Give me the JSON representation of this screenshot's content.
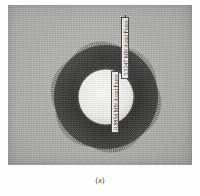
{
  "figure": {
    "caption": "(a)",
    "panel": {
      "background_color": "#b2b2b0",
      "description": "Radial axial-force vector plot around an annular cross-section"
    },
    "annotations": [
      {
        "name": "inner-axial-force-label",
        "text": "0.8854 MN Axial Force",
        "value": 0.8854,
        "unit": "MN",
        "quantity": "Axial Force",
        "orientation": "vertical"
      },
      {
        "name": "outer-axial-force-label",
        "text": "3.5247 MN Axial Force",
        "value": 3.5247,
        "unit": "MN",
        "quantity": "Axial Force",
        "orientation": "vertical"
      }
    ]
  },
  "chart_data": {
    "type": "scatter",
    "title": "",
    "subtitle": "",
    "xlabel": "",
    "ylabel": "",
    "legend_position": "none",
    "grid": false,
    "plot_style": "radial vector rosette (spoke plot) on annular section",
    "geometry": {
      "center_x": 97,
      "center_y": 92,
      "inner_radius": 27,
      "outer_radius": 52,
      "spoke_count": 180
    },
    "annotation_values": [
      0.8854,
      3.5247
    ],
    "annotation_unit": "MN",
    "annotation_labels": [
      "0.8854 MN Axial Force",
      "3.5247 MN Axial Force"
    ],
    "colors": {
      "panel_background": "#b2b2b0",
      "spoke": "#1b1b1b",
      "inner_disc": "#f2f1ee",
      "label_box": "#f4f3f0",
      "label_border": "#3a3a3a",
      "label_text": "#16161a",
      "caption_text": "#4a4a4a"
    }
  }
}
